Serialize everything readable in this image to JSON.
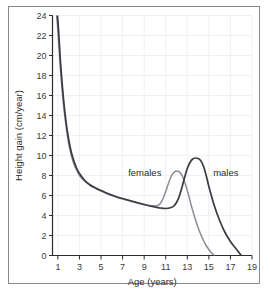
{
  "chart_data": {
    "type": "line",
    "title": "",
    "xlabel": "Age (years)",
    "ylabel": "Height gain (cm/year)",
    "xlim": [
      0.5,
      19
    ],
    "ylim": [
      0,
      24
    ],
    "xticks": [
      1,
      3,
      5,
      7,
      9,
      11,
      13,
      15,
      17,
      19
    ],
    "yticks": [
      0,
      2,
      4,
      6,
      8,
      10,
      12,
      14,
      16,
      18,
      20,
      22,
      24
    ],
    "grid": true,
    "legend_position": "inline-annotations",
    "annotations": [
      {
        "text": "females",
        "x": 10.6,
        "y": 8.3
      },
      {
        "text": "males",
        "x": 15.4,
        "y": 8.3
      }
    ],
    "colors": {
      "females": "#8c8c94",
      "males": "#3a3a42",
      "axis": "#2b2b2b",
      "grid": "#ececf2",
      "frame": "#8a8a8a",
      "background": "#ffffff"
    },
    "series": [
      {
        "name": "females",
        "x": [
          0.75,
          1.0,
          1.25,
          1.5,
          1.75,
          2.0,
          2.25,
          2.5,
          2.75,
          3.0,
          3.5,
          4.0,
          4.5,
          5.0,
          5.5,
          6.0,
          6.5,
          7.0,
          7.5,
          8.0,
          8.5,
          9.0,
          9.5,
          10.0,
          10.25,
          10.5,
          10.75,
          11.0,
          11.25,
          11.5,
          11.75,
          12.0,
          12.2,
          12.4,
          12.6,
          12.8,
          13.0,
          13.25,
          13.5,
          13.75,
          14.0,
          14.25,
          14.5,
          14.75,
          15.0,
          15.25,
          15.5
        ],
        "y": [
          25.5,
          22.5,
          18.4,
          15.3,
          13.0,
          11.2,
          10.0,
          9.1,
          8.5,
          8.0,
          7.4,
          7.0,
          6.7,
          6.45,
          6.2,
          6.0,
          5.8,
          5.65,
          5.5,
          5.35,
          5.2,
          5.1,
          5.0,
          4.95,
          5.0,
          5.2,
          5.7,
          6.4,
          7.2,
          7.9,
          8.3,
          8.45,
          8.4,
          8.2,
          7.8,
          7.2,
          6.5,
          5.5,
          4.5,
          3.6,
          2.8,
          2.1,
          1.5,
          1.0,
          0.6,
          0.25,
          0.0
        ]
      },
      {
        "name": "males",
        "x": [
          0.75,
          1.0,
          1.25,
          1.5,
          1.75,
          2.0,
          2.25,
          2.5,
          2.75,
          3.0,
          3.5,
          4.0,
          4.5,
          5.0,
          5.5,
          6.0,
          6.5,
          7.0,
          7.5,
          8.0,
          8.5,
          9.0,
          9.5,
          10.0,
          10.5,
          11.0,
          11.5,
          11.75,
          12.0,
          12.25,
          12.5,
          12.75,
          13.0,
          13.25,
          13.5,
          13.75,
          14.0,
          14.2,
          14.4,
          14.6,
          14.8,
          15.0,
          15.5,
          16.0,
          16.5,
          17.0,
          17.5,
          18.0
        ],
        "y": [
          26.0,
          23.5,
          19.2,
          15.9,
          13.4,
          11.6,
          10.3,
          9.4,
          8.7,
          8.2,
          7.5,
          7.05,
          6.75,
          6.5,
          6.25,
          6.05,
          5.85,
          5.7,
          5.55,
          5.4,
          5.25,
          5.1,
          4.95,
          4.85,
          4.75,
          4.7,
          4.8,
          4.95,
          5.3,
          5.9,
          6.8,
          7.8,
          8.7,
          9.3,
          9.65,
          9.75,
          9.7,
          9.55,
          9.2,
          8.6,
          7.8,
          6.9,
          5.0,
          3.5,
          2.3,
          1.4,
          0.7,
          0.0
        ]
      }
    ]
  },
  "figure": {
    "xaxis_title": "Age (years)",
    "yaxis_title": "Height gain (cm/year)",
    "label_females": "females",
    "label_males": "males"
  }
}
